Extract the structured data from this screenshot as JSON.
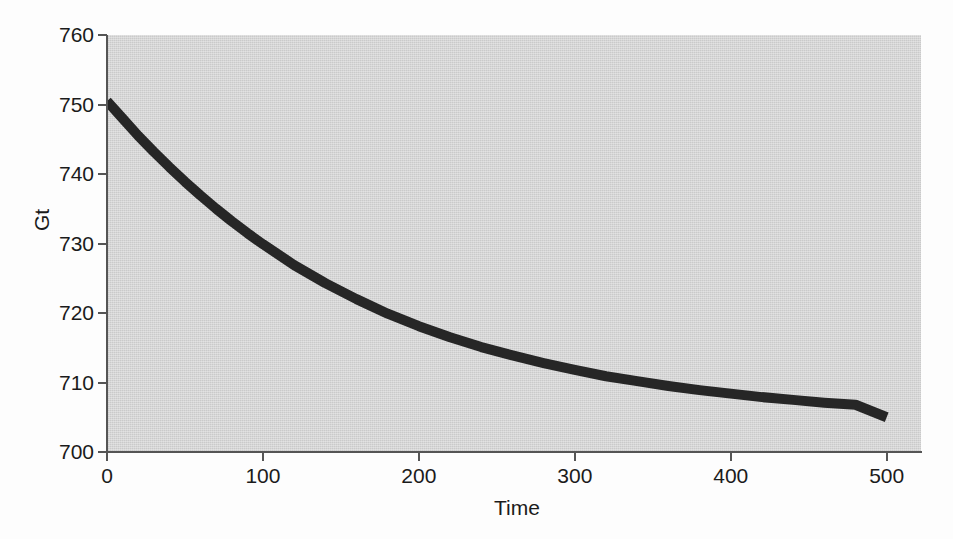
{
  "figure": {
    "background_color": "#fdfdfd",
    "panel_color": "#cacaca",
    "axis_color": "#555555",
    "text_color": "#1b1b1b"
  },
  "chart_data": {
    "type": "line",
    "title": "",
    "subtitle": "",
    "xlabel": "Time",
    "ylabel": "Gt",
    "xlim": [
      0,
      522
    ],
    "ylim": [
      700,
      760
    ],
    "xticks": [
      0,
      100,
      200,
      300,
      400,
      500
    ],
    "xtick_labels": [
      "0",
      "100",
      "200",
      "300",
      "400",
      "500"
    ],
    "yticks": [
      700,
      710,
      720,
      730,
      740,
      750,
      760
    ],
    "ytick_labels": [
      "700",
      "710",
      "720",
      "730",
      "740",
      "750",
      "760"
    ],
    "grid": false,
    "legend": null,
    "annotations": [],
    "series": [
      {
        "name": "Gt",
        "color": "#262626",
        "line_width": 10,
        "x": [
          0,
          10,
          20,
          30,
          40,
          50,
          60,
          70,
          80,
          90,
          100,
          120,
          140,
          160,
          180,
          200,
          220,
          240,
          260,
          280,
          300,
          320,
          340,
          360,
          380,
          400,
          420,
          440,
          460,
          480,
          500
        ],
        "values": [
          750.5,
          748.0,
          745.5,
          743.2,
          741.0,
          738.9,
          736.9,
          735.0,
          733.2,
          731.5,
          729.9,
          726.9,
          724.3,
          722.0,
          719.9,
          718.1,
          716.5,
          715.1,
          713.9,
          712.8,
          711.8,
          710.9,
          710.2,
          709.5,
          708.9,
          708.4,
          707.9,
          707.5,
          707.1,
          706.8,
          705.0
        ]
      }
    ]
  }
}
